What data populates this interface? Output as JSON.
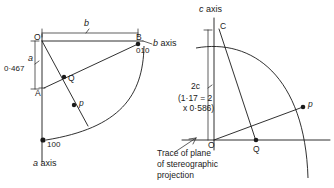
{
  "figure": {
    "left_diagram": {
      "name": "plan-view-ab",
      "axis_labels": {
        "b_axis": "b axis",
        "a_axis": "a axis"
      },
      "dimension_labels": {
        "b_length": "b",
        "a_symbol": "a",
        "a_value": "0·467"
      },
      "points": [
        {
          "id": "O",
          "label": "O"
        },
        {
          "id": "B",
          "label": "B"
        },
        {
          "id": "A",
          "label": "A"
        },
        {
          "id": "Q",
          "label": "Q"
        },
        {
          "id": "p",
          "label": "p"
        }
      ],
      "indices": [
        {
          "id": "B",
          "label": "010"
        },
        {
          "id": "a-intercept",
          "label": "100"
        }
      ]
    },
    "right_diagram": {
      "name": "elevation-view-c",
      "axis_labels": {
        "c_axis": "c axis"
      },
      "dimension_labels": {
        "c_symbol": "2c",
        "c_value_line1": "(1·17 = 2",
        "c_value_line2": "x 0·586)"
      },
      "points": [
        {
          "id": "C",
          "label": "C"
        },
        {
          "id": "O",
          "label": "O"
        },
        {
          "id": "Q",
          "label": "Q"
        },
        {
          "id": "p",
          "label": "p"
        }
      ],
      "annotation": {
        "line1": "Trace of plane",
        "line2": "of stereographic",
        "line3": "projection"
      }
    },
    "colors": {
      "ink": "#1a1a1a",
      "paper": "#ffffff"
    }
  }
}
